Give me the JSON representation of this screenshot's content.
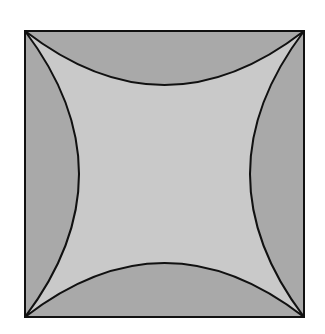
{
  "diagram": {
    "square": {
      "x": 25,
      "y": 31,
      "width": 279,
      "height": 286
    },
    "arc_sagitta": 54,
    "colors": {
      "background": "#ffffff",
      "outer_fill": "#a9a9a9",
      "inner_fill": "#c9c9c9",
      "stroke": "#111111"
    }
  }
}
